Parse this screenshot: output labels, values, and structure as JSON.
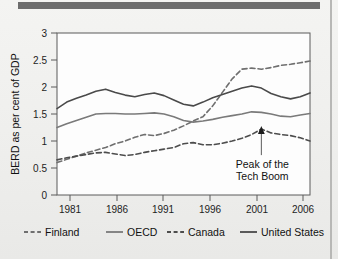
{
  "figure": {
    "ylabel": "BERD as per cent of GDP",
    "annotation_line1": "Peak of the",
    "annotation_line2": "Tech Boom",
    "annotation_icon": "up-arrow-icon"
  },
  "axes": {
    "y_ticks": [
      "0",
      "0.5",
      "1",
      "1.5",
      "2",
      "2.5",
      "3"
    ],
    "x_ticks": [
      "1981",
      "1986",
      "1991",
      "1996",
      "2001",
      "2006"
    ]
  },
  "legend": {
    "items": [
      {
        "label": "Finland",
        "style": "dashed",
        "color": "#6f6f6f"
      },
      {
        "label": "OECD",
        "style": "solid",
        "color": "#7a7a7a"
      },
      {
        "label": "Canada",
        "style": "dashed",
        "color": "#4d4d4d"
      },
      {
        "label": "United States",
        "style": "solid",
        "color": "#4a4a4a"
      }
    ]
  },
  "chart_data": {
    "type": "line",
    "title": "",
    "xlabel": "",
    "ylabel": "BERD as per cent of GDP",
    "xlim": [
      1980,
      2006
    ],
    "ylim": [
      0,
      3
    ],
    "grid": false,
    "legend_position": "bottom",
    "x": [
      1980,
      1981,
      1982,
      1983,
      1984,
      1985,
      1986,
      1987,
      1988,
      1989,
      1990,
      1991,
      1992,
      1993,
      1994,
      1995,
      1996,
      1997,
      1998,
      1999,
      2000,
      2001,
      2002,
      2003,
      2004,
      2005,
      2006
    ],
    "series": [
      {
        "name": "Finland",
        "style": "dashed",
        "color": "#6f6f6f",
        "values": [
          0.6,
          0.66,
          0.72,
          0.78,
          0.83,
          0.88,
          0.95,
          1.0,
          1.07,
          1.12,
          1.1,
          1.14,
          1.2,
          1.28,
          1.37,
          1.45,
          1.65,
          1.9,
          2.15,
          2.33,
          2.35,
          2.33,
          2.36,
          2.4,
          2.42,
          2.45,
          2.48
        ]
      },
      {
        "name": "OECD",
        "style": "solid",
        "color": "#7a7a7a",
        "values": [
          1.25,
          1.32,
          1.38,
          1.44,
          1.5,
          1.51,
          1.51,
          1.5,
          1.5,
          1.51,
          1.52,
          1.5,
          1.45,
          1.38,
          1.35,
          1.37,
          1.4,
          1.44,
          1.47,
          1.5,
          1.54,
          1.53,
          1.5,
          1.46,
          1.45,
          1.48,
          1.51
        ]
      },
      {
        "name": "Canada",
        "style": "dashed",
        "color": "#4d4d4d",
        "values": [
          0.65,
          0.69,
          0.72,
          0.75,
          0.78,
          0.79,
          0.76,
          0.73,
          0.75,
          0.79,
          0.82,
          0.85,
          0.88,
          0.95,
          0.97,
          0.93,
          0.93,
          0.96,
          1.0,
          1.05,
          1.12,
          1.22,
          1.15,
          1.12,
          1.1,
          1.06,
          1.0
        ]
      },
      {
        "name": "United States",
        "style": "solid",
        "color": "#4a4a4a",
        "values": [
          1.6,
          1.72,
          1.79,
          1.85,
          1.92,
          1.96,
          1.9,
          1.85,
          1.82,
          1.86,
          1.89,
          1.84,
          1.76,
          1.68,
          1.65,
          1.72,
          1.8,
          1.86,
          1.92,
          1.98,
          2.02,
          1.98,
          1.88,
          1.82,
          1.78,
          1.82,
          1.89
        ]
      }
    ],
    "annotations": [
      {
        "text": "Peak of the Tech Boom",
        "target_series": "Canada",
        "target_x": 2001,
        "target_y": 1.22
      }
    ]
  }
}
